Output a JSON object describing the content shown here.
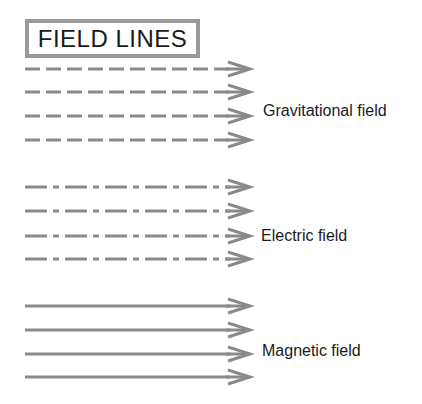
{
  "title": "FIELD LINES",
  "colors": {
    "line": "#8a8a8a",
    "border": "#9a9a9a",
    "text": "#1a1a1a"
  },
  "groups": [
    {
      "label": "Gravitational field",
      "style": "dashed",
      "label_x": 263,
      "label_y": 102,
      "lines": [
        69,
        92,
        116,
        140
      ],
      "x_start": 25,
      "x_end": 250
    },
    {
      "label": "Electric field",
      "style": "dash-dot",
      "label_x": 261,
      "label_y": 227,
      "lines": [
        187,
        211,
        236,
        259
      ],
      "x_start": 25,
      "x_end": 250
    },
    {
      "label": "Magnetic field",
      "style": "solid",
      "label_x": 262,
      "label_y": 342,
      "lines": [
        306,
        330,
        354,
        377
      ],
      "x_start": 25,
      "x_end": 250
    }
  ]
}
